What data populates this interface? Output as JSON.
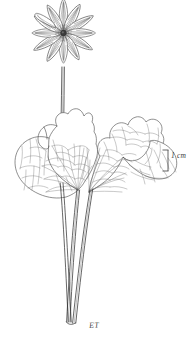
{
  "figure": {
    "kind": "botanical-line-illustration",
    "background_color": "#ffffff",
    "ink_color": "#4a4a4a",
    "ink_color_dark": "#2b2b2b"
  },
  "scale_bar": {
    "label": "1 cm",
    "orientation": "vertical",
    "bracket_glyph": "]",
    "color": "#4a4a4a"
  },
  "signature": {
    "initials": "ET",
    "color": "#4a4a4a"
  },
  "flower": {
    "name": "terminal-flower",
    "petal_count": 12,
    "center": "dense radiating stamens",
    "symmetry": "radial"
  },
  "leaves": [
    {
      "name": "left-basal-leaf",
      "venation": "reticulate",
      "margin": "lobed"
    },
    {
      "name": "right-basal-leaf",
      "venation": "reticulate",
      "margin": "lobed"
    }
  ],
  "stems": {
    "name": "converging-petioles",
    "count": 3
  }
}
